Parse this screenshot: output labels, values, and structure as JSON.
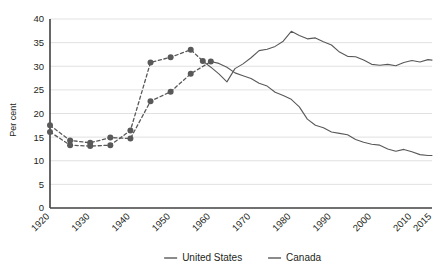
{
  "chart_data": {
    "type": "line",
    "title": "",
    "subtitle": "",
    "xlabel": "",
    "ylabel": "Per cent",
    "xlim": [
      1920,
      2015
    ],
    "ylim": [
      0,
      40
    ],
    "grid": true,
    "grid_axis": "y",
    "legend_position": "bottom-center",
    "y_ticks": [
      0,
      5,
      10,
      15,
      20,
      25,
      30,
      35,
      40
    ],
    "y_tick_labels": [
      "0",
      "5",
      "10",
      "15",
      "20",
      "25",
      "30",
      "35",
      "40"
    ],
    "x_ticks": [
      1920,
      1930,
      1940,
      1950,
      1960,
      1970,
      1980,
      1990,
      2000,
      2010,
      2015
    ],
    "x_tick_labels": [
      "1920",
      "1930",
      "1940",
      "1950",
      "1960",
      "1970",
      "1980",
      "1990",
      "2000",
      "2010",
      "2015"
    ],
    "series": [
      {
        "name": "United States",
        "color": "#595959",
        "marker_phase": {
          "style": "dashed",
          "marker": "circle",
          "x": [
            1920,
            1925,
            1930,
            1935,
            1940,
            1945,
            1950,
            1955,
            1960
          ],
          "values": [
            17.5,
            14.3,
            13.8,
            14.9,
            14.7,
            22.6,
            24.6,
            28.4,
            31.0
          ]
        },
        "line_phase": {
          "style": "solid",
          "x": [
            1960,
            1962,
            1964,
            1966,
            1968,
            1970,
            1972,
            1974,
            1976,
            1978,
            1980,
            1982,
            1984,
            1986,
            1988,
            1990,
            1992,
            1994,
            1996,
            1998,
            2000,
            2002,
            2004,
            2006,
            2008,
            2010,
            2012,
            2014,
            2015
          ],
          "values": [
            31.0,
            30.6,
            29.8,
            28.6,
            28.0,
            27.4,
            26.4,
            25.8,
            24.5,
            23.8,
            23.0,
            21.4,
            18.8,
            17.5,
            17.0,
            16.1,
            15.8,
            15.5,
            14.5,
            13.9,
            13.5,
            13.3,
            12.5,
            12.0,
            12.4,
            11.9,
            11.3,
            11.1,
            11.1
          ]
        }
      },
      {
        "name": "Canada",
        "color": "#595959",
        "marker_phase": {
          "style": "dashed",
          "marker": "circle",
          "x": [
            1920,
            1925,
            1930,
            1935,
            1940,
            1945,
            1950,
            1955,
            1958
          ],
          "values": [
            16.1,
            13.3,
            13.1,
            13.3,
            16.4,
            30.8,
            31.9,
            33.5,
            31.1
          ]
        },
        "line_phase": {
          "style": "solid",
          "x": [
            1958,
            1960,
            1962,
            1964,
            1966,
            1968,
            1970,
            1972,
            1974,
            1976,
            1978,
            1980,
            1982,
            1984,
            1986,
            1988,
            1990,
            1992,
            1994,
            1996,
            1998,
            2000,
            2002,
            2004,
            2006,
            2008,
            2010,
            2012,
            2014,
            2015
          ],
          "values": [
            31.1,
            29.8,
            28.4,
            26.7,
            29.5,
            30.5,
            31.8,
            33.3,
            33.6,
            34.2,
            35.3,
            37.4,
            36.5,
            35.8,
            36.0,
            35.2,
            34.5,
            33.0,
            32.1,
            32.0,
            31.3,
            30.4,
            30.2,
            30.4,
            30.1,
            30.8,
            31.2,
            30.9,
            31.4,
            31.3
          ]
        }
      }
    ]
  },
  "legend": {
    "items": [
      {
        "label": "United States",
        "color": "#595959"
      },
      {
        "label": "Canada",
        "color": "#595959"
      }
    ]
  },
  "axes": {
    "y_axis_label": "Per cent"
  },
  "colors": {
    "line": "#595959",
    "grid": "#d9d9d9",
    "axis": "#404040",
    "text": "#231f20"
  }
}
